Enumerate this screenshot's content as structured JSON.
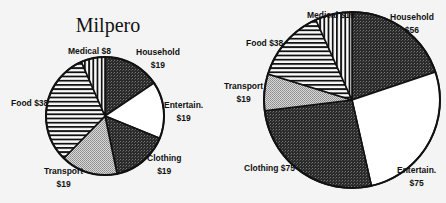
{
  "chart_data": [
    {
      "type": "pie",
      "title": "Milpero",
      "categories": [
        "Household",
        "Entertain.",
        "Clothing",
        "Transport",
        "Food",
        "Medical"
      ],
      "values": [
        19,
        19,
        19,
        19,
        38,
        8
      ],
      "labels": [
        "Household $19",
        "Entertain. $19",
        "Clothing $19",
        "Transport $19",
        "Food $38",
        "Medical $8"
      ],
      "start_angle": "12 o'clock, clockwise",
      "fills": [
        "dark-stipple",
        "white",
        "dark-stipple",
        "light-stipple",
        "horizontal-stripes",
        "vertical-stripes"
      ]
    },
    {
      "type": "pie",
      "title": "",
      "categories": [
        "Household",
        "Entertain.",
        "Clothing",
        "Transport",
        "Food",
        "Medical"
      ],
      "values": [
        56,
        75,
        75,
        19,
        38,
        19
      ],
      "labels": [
        "Household $56",
        "Entertain. $75",
        "Clothing $75",
        "Transport $19",
        "Food $38",
        "Medical $19"
      ],
      "start_angle": "12 o'clock, clockwise",
      "fills": [
        "dark-stipple",
        "white",
        "dark-stipple",
        "light-stipple",
        "horizontal-stripes",
        "vertical-stripes"
      ]
    }
  ],
  "left": {
    "title": "Milpero",
    "labels": {
      "household": [
        "Household",
        "$19"
      ],
      "entertain": [
        "Entertain.",
        "$19"
      ],
      "clothing": [
        "Clothing",
        "$19"
      ],
      "transport": [
        "Transport",
        "$19"
      ],
      "food": "Food $38",
      "medical": "Medical $8"
    }
  },
  "right": {
    "labels": {
      "household": [
        "Household",
        "$56"
      ],
      "entertain": [
        "Entertain.",
        "$75"
      ],
      "clothing": "Clothing $75",
      "transport": [
        "Transport",
        "$19"
      ],
      "food": "Food $38",
      "medical": "Medical $19"
    }
  }
}
